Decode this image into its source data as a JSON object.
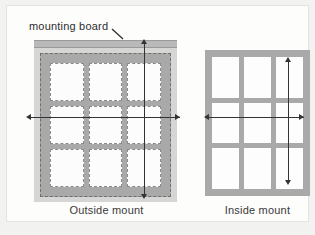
{
  "figure": {
    "annotation_label": "mounting board",
    "diagrams": [
      {
        "id": "outside",
        "caption": "Outside mount",
        "panes_rows": 3,
        "panes_cols": 3,
        "width_dimension_label": "",
        "height_dimension_label": ""
      },
      {
        "id": "inside",
        "caption": "Inside mount",
        "panes_rows": 3,
        "panes_cols": 3,
        "width_dimension_label": "",
        "height_dimension_label": ""
      }
    ]
  },
  "colors": {
    "page_background": "#f2f2f0",
    "canvas_background": "#fdfdfc",
    "board_fill": "#d6d6d4",
    "blind_fill": "#a9a9a9",
    "mounting_board_fill": "#b9b9b9",
    "pane_fill": "#fcfcfc",
    "dimension_line": "#333333",
    "dashed_outline": "#6e6e6e",
    "text": "#2e2e2e"
  }
}
